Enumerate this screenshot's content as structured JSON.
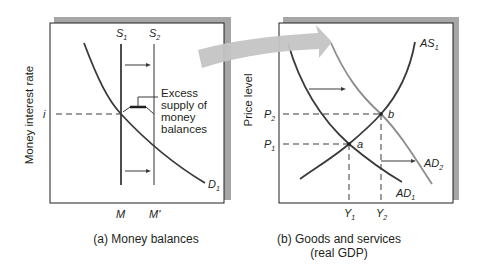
{
  "panel_a": {
    "caption": "(a) Money balances",
    "y_axis_label": "Money interest rate",
    "supply_1_label": "S",
    "supply_1_sub": "1",
    "supply_2_label": "S",
    "supply_2_sub": "2",
    "demand_label": "D",
    "demand_sub": "1",
    "rate_label": "i",
    "qty_1_label": "M",
    "qty_2_label": "M'",
    "annotation_lines": [
      "Excess",
      "supply of",
      "money",
      "balances"
    ]
  },
  "panel_b": {
    "caption_line1": "(b) Goods and services",
    "caption_line2": "(real GDP)",
    "y_axis_label": "Price level",
    "as_label": "AS",
    "as_sub": "1",
    "ad1_label": "AD",
    "ad1_sub": "1",
    "ad2_label": "AD",
    "ad2_sub": "2",
    "p1_label": "P",
    "p1_sub": "1",
    "p2_label": "P",
    "p2_sub": "2",
    "y1_label": "Y",
    "y1_sub": "1",
    "y2_label": "Y",
    "y2_sub": "2",
    "point_a": "a",
    "point_b": "b"
  },
  "colors": {
    "curve": "#3a3a3a",
    "shifted_curve": "#8c8c8c",
    "shadow": "#a6a6a6",
    "link_arrow": "#c4c4c4"
  }
}
